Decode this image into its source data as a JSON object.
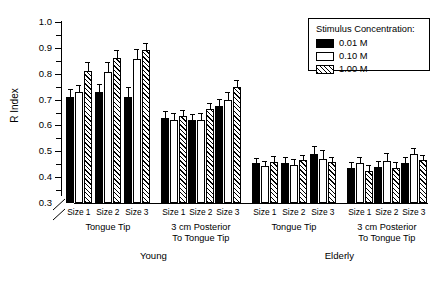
{
  "chart_data": {
    "type": "bar",
    "title": "",
    "xlabel": "",
    "ylabel": "R Index",
    "ylim": [
      0.3,
      1.0
    ],
    "y_axis_break": true,
    "y_break_note": "axis broken between 0 and 0.3",
    "grid": false,
    "ytick_labels": [
      "1.0",
      "0.9",
      "0.8",
      "0.7",
      "0.6",
      "0.5",
      "0.4",
      "0.3"
    ],
    "ytick_values": [
      1.0,
      0.9,
      0.8,
      0.7,
      0.6,
      0.5,
      0.4,
      0.3
    ],
    "legend": {
      "title": "Stimulus Concentration:",
      "position": "top-right",
      "entries": [
        {
          "label": "0.01 M",
          "fill": "solid-black"
        },
        {
          "label": "0.10 M",
          "fill": "white"
        },
        {
          "label": "1.00 M",
          "fill": "diagonal-hatch"
        }
      ]
    },
    "series": [
      {
        "name": "0.01 M",
        "values": [
          0.71,
          0.728,
          0.71,
          0.63,
          0.62,
          0.675,
          0.455,
          0.455,
          0.49,
          0.435,
          0.44,
          0.455
        ]
      },
      {
        "name": "0.10 M",
        "values": [
          0.728,
          0.808,
          0.858,
          0.622,
          0.622,
          0.7,
          0.442,
          0.447,
          0.472,
          0.455,
          0.462,
          0.49
        ]
      },
      {
        "name": "1.00 M",
        "values": [
          0.812,
          0.862,
          0.89,
          0.637,
          0.662,
          0.75,
          0.46,
          0.465,
          0.457,
          0.425,
          0.437,
          0.465
        ]
      }
    ],
    "errors": [
      {
        "name": "0.01 M",
        "values": [
          0.03,
          0.033,
          0.04,
          0.025,
          0.025,
          0.028,
          0.02,
          0.022,
          0.03,
          0.022,
          0.022,
          0.022
        ]
      },
      {
        "name": "0.10 M",
        "values": [
          0.03,
          0.038,
          0.036,
          0.025,
          0.025,
          0.03,
          0.02,
          0.024,
          0.032,
          0.022,
          0.03,
          0.022
        ]
      },
      {
        "name": "1.00 M",
        "values": [
          0.032,
          0.03,
          0.03,
          0.022,
          0.025,
          0.026,
          0.022,
          0.022,
          0.022,
          0.022,
          0.022,
          0.022
        ]
      }
    ],
    "categories": [
      "Size 1",
      "Size 2",
      "Size 3",
      "Size 1",
      "Size 2",
      "Size 3",
      "Size 1",
      "Size 2",
      "Size 3",
      "Size 1",
      "Size 2",
      "Size 3"
    ],
    "site_groups": [
      {
        "label": "Tongue Tip",
        "span": 3
      },
      {
        "label": "3 cm Posterior\nTo Tongue Tip",
        "span": 3
      },
      {
        "label": "Tongue Tip",
        "span": 3
      },
      {
        "label": "3 cm Posterior\nTo Tongue Tip",
        "span": 3
      }
    ],
    "age_groups": [
      {
        "label": "Young",
        "span": 6
      },
      {
        "label": "Elderly",
        "span": 6
      }
    ]
  },
  "axis": {
    "ylabel": "R Index"
  },
  "sitelabels": {
    "tongue_tip": "Tongue Tip",
    "posterior_line1": "3 cm Posterior",
    "posterior_line2": "To Tongue Tip"
  },
  "agelabels": {
    "young": "Young",
    "elderly": "Elderly"
  }
}
